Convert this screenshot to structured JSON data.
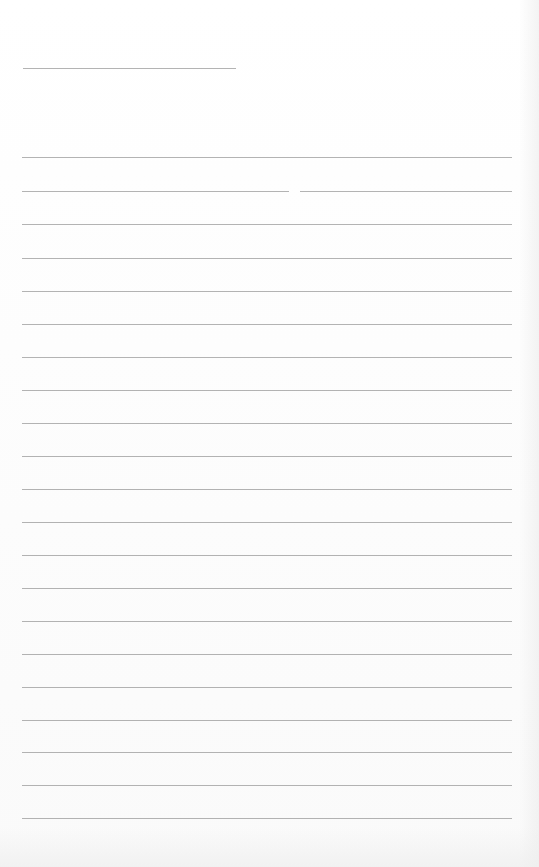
{
  "page": {
    "type": "lined-paper",
    "background_color": "#fdfdfd",
    "rule_color": "#9a9a9a",
    "title_rule": {
      "y": 68,
      "x_start": 23,
      "x_end": 236
    },
    "rules": [
      {
        "y": 157,
        "x_start": 22,
        "x_end": 512
      },
      {
        "y": 191,
        "x_start": 22,
        "x_end": 512,
        "gap": [
          289,
          300
        ]
      },
      {
        "y": 224,
        "x_start": 22,
        "x_end": 512
      },
      {
        "y": 258,
        "x_start": 22,
        "x_end": 512
      },
      {
        "y": 291,
        "x_start": 22,
        "x_end": 512
      },
      {
        "y": 324,
        "x_start": 22,
        "x_end": 512
      },
      {
        "y": 357,
        "x_start": 22,
        "x_end": 512
      },
      {
        "y": 390,
        "x_start": 22,
        "x_end": 512
      },
      {
        "y": 423,
        "x_start": 22,
        "x_end": 512
      },
      {
        "y": 456,
        "x_start": 22,
        "x_end": 512
      },
      {
        "y": 489,
        "x_start": 22,
        "x_end": 512
      },
      {
        "y": 522,
        "x_start": 22,
        "x_end": 512
      },
      {
        "y": 555,
        "x_start": 22,
        "x_end": 512
      },
      {
        "y": 588,
        "x_start": 22,
        "x_end": 512
      },
      {
        "y": 621,
        "x_start": 22,
        "x_end": 512
      },
      {
        "y": 654,
        "x_start": 22,
        "x_end": 512
      },
      {
        "y": 687,
        "x_start": 22,
        "x_end": 512
      },
      {
        "y": 720,
        "x_start": 22,
        "x_end": 512
      },
      {
        "y": 752,
        "x_start": 22,
        "x_end": 512
      },
      {
        "y": 785,
        "x_start": 22,
        "x_end": 512
      },
      {
        "y": 818,
        "x_start": 22,
        "x_end": 512
      }
    ]
  }
}
